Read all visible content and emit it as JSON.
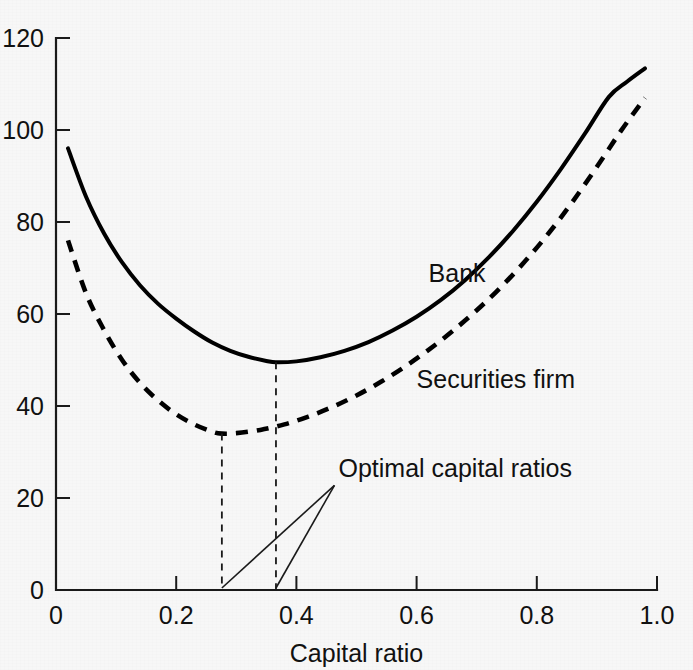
{
  "chart_data": {
    "type": "line",
    "title": "",
    "xlabel": "Capital ratio",
    "ylabel": "",
    "xlim": [
      0,
      1.0
    ],
    "ylim": [
      0,
      120
    ],
    "grid": false,
    "legend_position": "inline-labels",
    "x_ticks": [
      "0",
      "0.2",
      "0.4",
      "0.6",
      "0.8",
      "1.0"
    ],
    "x_tick_values": [
      0,
      0.2,
      0.4,
      0.6,
      0.8,
      1.0
    ],
    "y_ticks": [
      "0",
      "20",
      "40",
      "60",
      "80",
      "100",
      "120"
    ],
    "y_tick_values": [
      0,
      20,
      40,
      60,
      80,
      100,
      120
    ],
    "series": [
      {
        "name": "Bank",
        "style": "solid",
        "label_x": 0.62,
        "label_y": 67,
        "minimum": {
          "x": 0.366,
          "y": 49.5
        },
        "x": [
          0.02,
          0.05,
          0.08,
          0.11,
          0.14,
          0.17,
          0.2,
          0.23,
          0.26,
          0.29,
          0.32,
          0.35,
          0.366,
          0.4,
          0.44,
          0.48,
          0.52,
          0.56,
          0.6,
          0.64,
          0.68,
          0.72,
          0.76,
          0.8,
          0.84,
          0.88,
          0.92,
          0.95,
          0.98
        ],
        "values": [
          96.0,
          85.5,
          77.5,
          71.2,
          66.2,
          62.2,
          59.0,
          56.2,
          53.8,
          52.0,
          50.7,
          49.8,
          49.5,
          49.7,
          50.6,
          52.0,
          53.9,
          56.4,
          59.4,
          63.0,
          67.3,
          72.3,
          78.0,
          84.4,
          91.5,
          99.2,
          107.2,
          110.5,
          113.4
        ]
      },
      {
        "name": "Securities firm",
        "style": "dashed",
        "label_x": 0.6,
        "label_y": 44,
        "minimum": {
          "x": 0.276,
          "y": 34.0
        },
        "x": [
          0.02,
          0.05,
          0.08,
          0.11,
          0.14,
          0.17,
          0.2,
          0.23,
          0.26,
          0.276,
          0.3,
          0.34,
          0.38,
          0.42,
          0.46,
          0.5,
          0.54,
          0.58,
          0.62,
          0.66,
          0.7,
          0.74,
          0.78,
          0.82,
          0.86,
          0.9,
          0.94,
          0.98
        ],
        "values": [
          76.0,
          64.5,
          56.5,
          50.0,
          45.0,
          41.2,
          38.2,
          36.0,
          34.4,
          34.0,
          34.1,
          34.8,
          36.0,
          37.7,
          39.8,
          42.3,
          45.2,
          48.5,
          52.2,
          56.3,
          60.8,
          65.8,
          71.4,
          77.6,
          84.5,
          92.0,
          99.8,
          107.0
        ]
      }
    ],
    "annotations": [
      {
        "text": "Optimal capital ratios",
        "text_x": 0.47,
        "text_y": 24.5,
        "points_to": [
          0.276,
          0.366
        ]
      }
    ]
  },
  "colors": {
    "background": "#f7f7f7",
    "ink": "#111111",
    "axis": "#1a1a1a",
    "curve": "#000000"
  }
}
